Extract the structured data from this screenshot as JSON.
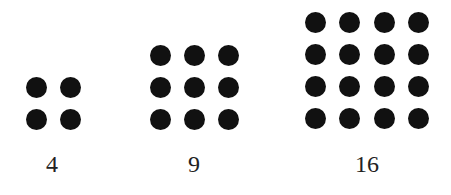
{
  "diagram": {
    "title": "",
    "dot_color": "#111111",
    "groups": [
      {
        "label": "4",
        "rows": 2,
        "cols": 2,
        "label_x": 52,
        "xs": [
          36,
          70
        ],
        "ys": [
          87,
          119
        ]
      },
      {
        "label": "9",
        "rows": 3,
        "cols": 3,
        "label_x": 194,
        "xs": [
          160,
          194,
          228
        ],
        "ys": [
          55,
          87,
          119
        ]
      },
      {
        "label": "16",
        "rows": 4,
        "cols": 4,
        "label_x": 367,
        "xs": [
          315,
          349,
          384,
          418
        ],
        "ys": [
          22,
          54,
          86,
          118
        ]
      }
    ],
    "label_y": 152
  }
}
